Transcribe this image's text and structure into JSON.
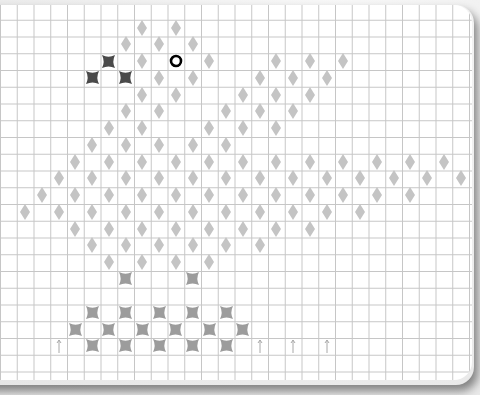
{
  "board": {
    "cell_size": 16.75,
    "col_origin": 8.4,
    "row_origin": 10.75,
    "colors": {
      "diamond": "#c4c4c4",
      "enemy_cross": "#4a4a4a",
      "light_cross": "#9c9c9c",
      "arrow": "#a8a8a8",
      "player_ring": "#000000",
      "grid_line": "#c6c6c6"
    },
    "markers": [
      {
        "type": "diamond",
        "row": 1,
        "cols": [
          8,
          10
        ]
      },
      {
        "type": "diamond",
        "row": 2,
        "cols": [
          7,
          9,
          11
        ]
      },
      {
        "type": "dark-cross",
        "row": 3,
        "cols": [
          6
        ]
      },
      {
        "type": "diamond",
        "row": 3,
        "cols": [
          8,
          12,
          16,
          18,
          20
        ]
      },
      {
        "type": "ring",
        "row": 3,
        "cols": [
          10
        ]
      },
      {
        "type": "dark-cross",
        "row": 4,
        "cols": [
          5,
          7
        ]
      },
      {
        "type": "diamond",
        "row": 4,
        "cols": [
          9,
          11,
          15,
          17,
          19
        ]
      },
      {
        "type": "diamond",
        "row": 5,
        "cols": [
          8,
          10,
          14,
          16,
          18
        ]
      },
      {
        "type": "diamond",
        "row": 6,
        "cols": [
          7,
          9,
          13,
          15,
          17
        ]
      },
      {
        "type": "diamond",
        "row": 7,
        "cols": [
          6,
          8,
          12,
          14,
          16
        ]
      },
      {
        "type": "diamond",
        "row": 8,
        "cols": [
          5,
          7,
          9,
          11,
          13
        ]
      },
      {
        "type": "diamond",
        "row": 9,
        "cols": [
          4,
          6,
          8,
          10,
          12,
          14,
          16,
          18,
          20,
          22,
          24,
          26
        ]
      },
      {
        "type": "diamond",
        "row": 10,
        "cols": [
          3,
          5,
          7,
          9,
          11,
          13,
          15,
          17,
          19,
          21,
          23,
          25,
          27
        ]
      },
      {
        "type": "diamond",
        "row": 11,
        "cols": [
          2,
          4,
          6,
          8,
          10,
          12,
          14,
          16,
          18,
          20,
          22,
          24
        ]
      },
      {
        "type": "diamond",
        "row": 12,
        "cols": [
          1,
          3,
          5,
          7,
          9,
          11,
          13,
          15,
          17,
          19,
          21
        ]
      },
      {
        "type": "diamond",
        "row": 13,
        "cols": [
          4,
          6,
          8,
          10,
          12,
          14,
          16,
          18
        ]
      },
      {
        "type": "diamond",
        "row": 14,
        "cols": [
          5,
          7,
          9,
          11,
          13,
          15
        ]
      },
      {
        "type": "diamond",
        "row": 15,
        "cols": [
          6,
          8,
          10,
          12
        ]
      },
      {
        "type": "light-cross",
        "row": 16,
        "cols": [
          7,
          11
        ]
      },
      {
        "type": "light-cross",
        "row": 18,
        "cols": [
          5,
          7,
          9,
          11,
          13
        ]
      },
      {
        "type": "light-cross",
        "row": 19,
        "cols": [
          4,
          6,
          8,
          10,
          12,
          14
        ]
      },
      {
        "type": "light-cross",
        "row": 20,
        "cols": [
          5,
          7,
          9,
          11,
          13
        ]
      },
      {
        "type": "arrow-up",
        "row": 20,
        "cols": [
          3,
          15,
          17,
          19
        ]
      }
    ]
  }
}
